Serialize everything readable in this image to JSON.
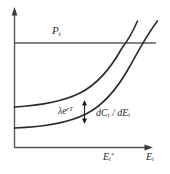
{
  "figure": {
    "type": "economics-diagram",
    "background_color": "#ffffff",
    "axes": {
      "vertical_axis_name": "price-cost-axis",
      "horizontal_axis_name": "emissions-axis",
      "horizontal_axis_label": "E",
      "horizontal_axis_label_sub": "t",
      "arrowheads": true
    },
    "labels": {
      "price_line": {
        "base": "P",
        "sub": "t"
      },
      "gap": {
        "base": "λe",
        "sup": "rT"
      },
      "marginal_cost": {
        "base": "dC",
        "sub1": "t",
        "mid": " / dE",
        "sub2": "t"
      },
      "e_star": {
        "base": "E",
        "sub": "t",
        "sup": "*"
      },
      "e_axis": {
        "base": "E",
        "sub": "t"
      }
    },
    "curves": [
      {
        "name": "upper-marginal-cost-curve",
        "color": "#2b2b2b"
      },
      {
        "name": "lower-marginal-cost-curve",
        "color": "#2b2b2b"
      }
    ],
    "price_line_color": "#5a5a5a",
    "axis_color": "#555555",
    "annotation": {
      "name": "gap-double-arrow",
      "color": "#1f1f1f"
    }
  }
}
